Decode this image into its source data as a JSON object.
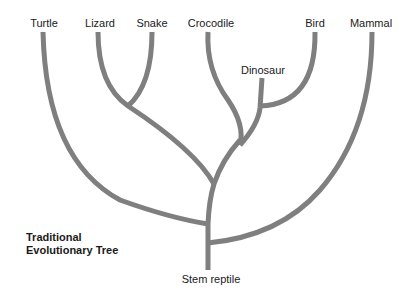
{
  "diagram": {
    "title_line1": "Traditional",
    "title_line2": "Evolutionary Tree",
    "branch_color": "#7f7f7f",
    "root_label": "Stem reptile",
    "taxa": [
      {
        "name": "Turtle"
      },
      {
        "name": "Lizard"
      },
      {
        "name": "Snake"
      },
      {
        "name": "Crocodile"
      },
      {
        "name": "Dinosaur"
      },
      {
        "name": "Bird"
      },
      {
        "name": "Mammal"
      }
    ]
  }
}
